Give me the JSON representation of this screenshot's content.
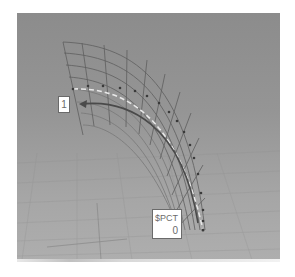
{
  "viewport": {
    "type": "3d-perspective-view",
    "background_top": "#8c8c8c",
    "background_bottom": "#aeaeae",
    "grid_color": "#9a9a9a",
    "mesh_color": "#5e5e5e",
    "path_color": "#4a4a4a",
    "dashed_line_color": "#e6e6e6"
  },
  "labels": {
    "end_marker": {
      "text": "1"
    },
    "start_marker": {
      "name": "$PCT",
      "value": "0"
    }
  },
  "icons": {
    "path_arrow": "arrow-left-icon"
  }
}
